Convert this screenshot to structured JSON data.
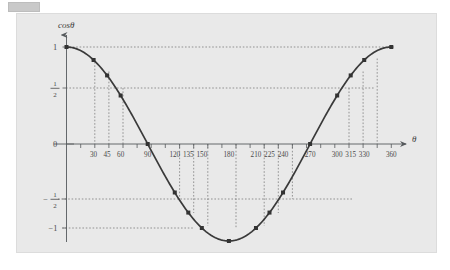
{
  "top_bar": {
    "name": "gray-placeholder-bar"
  },
  "chart_data": {
    "type": "line",
    "title": "",
    "xlabel": "θ",
    "ylabel": "cosθ",
    "xlim": [
      0,
      372
    ],
    "ylim": [
      -1.25,
      1.2
    ],
    "grid": false,
    "legend": "none",
    "x": [
      0,
      30,
      45,
      60,
      90,
      120,
      135,
      150,
      180,
      210,
      225,
      240,
      270,
      300,
      315,
      330,
      360
    ],
    "values": [
      1,
      0.866,
      0.707,
      0.5,
      0,
      -0.5,
      -0.707,
      -0.866,
      -1,
      -0.866,
      -0.707,
      -0.5,
      0,
      0.5,
      0.707,
      0.866,
      1
    ],
    "marker": "square",
    "curve_color": "#3a3a3a",
    "marker_color": "#333333",
    "guide_color": "#6f6f6f",
    "axis_color": "#55595c",
    "background_color": "#e9e9e9",
    "x_tick_labels": [
      "30",
      "45",
      "60",
      "90",
      "120",
      "135",
      "150",
      "180",
      "210",
      "225",
      "240",
      "270",
      "300",
      "315",
      "330",
      "360"
    ],
    "x_tick_values": [
      30,
      45,
      60,
      90,
      120,
      135,
      150,
      180,
      210,
      225,
      240,
      270,
      300,
      315,
      330,
      360
    ],
    "y_tick_labels": [
      "1",
      "1/2",
      "0",
      "-1/2",
      "-1"
    ],
    "y_tick_values": [
      1,
      0.5,
      0,
      -0.5,
      -1
    ],
    "horizontal_guides": [
      1,
      0.5,
      -0.5,
      -1
    ],
    "vertical_guides": [
      30,
      45,
      60,
      120,
      135,
      150,
      180,
      210,
      225,
      240,
      300,
      315,
      330
    ]
  },
  "y_axis": {
    "label": "cosθ",
    "tick_1": "1",
    "tick_half_num": "1",
    "tick_half_den": "2",
    "tick_0": "0",
    "tick_neg_half_sign": "−",
    "tick_neg_half_num": "1",
    "tick_neg_half_den": "2",
    "tick_neg_1": "−1"
  },
  "x_axis": {
    "label": "θ",
    "ticks": [
      "30",
      "45",
      "60",
      "90",
      "120",
      "135",
      "150",
      "180",
      "210",
      "225",
      "240",
      "270",
      "300",
      "315",
      "330",
      "360"
    ]
  }
}
